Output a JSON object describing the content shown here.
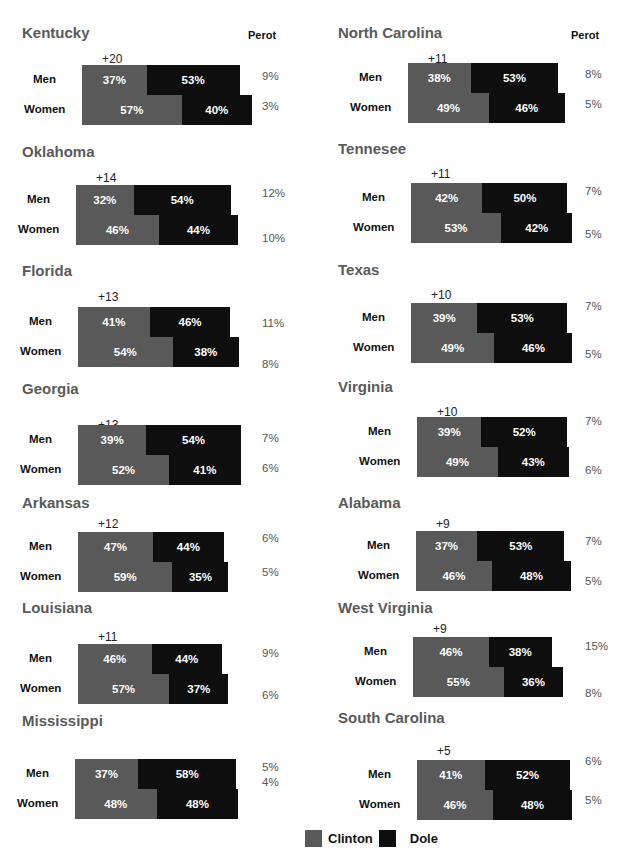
{
  "perot_header": "Perot",
  "legend": [
    {
      "label": "Clinton",
      "color": "#595959"
    },
    {
      "label": "Dole",
      "color": "#0e0e0e"
    }
  ],
  "panels": [
    {
      "state": "Kentucky",
      "gap": "+20",
      "men": {
        "label": "Men",
        "clinton": "37%",
        "dole": "53%",
        "perot": "9%"
      },
      "women": {
        "label": "Women",
        "clinton": "57%",
        "dole": "40%",
        "perot": "3%"
      }
    },
    {
      "state": "Oklahoma",
      "gap": "+14",
      "men": {
        "label": "Men",
        "clinton": "32%",
        "dole": "54%",
        "perot": "12%"
      },
      "women": {
        "label": "Women",
        "clinton": "46%",
        "dole": "44%",
        "perot": "10%"
      }
    },
    {
      "state": "Florida",
      "gap": "+13",
      "men": {
        "label": "Men",
        "clinton": "41%",
        "dole": "46%",
        "perot": "11%"
      },
      "women": {
        "label": "Women",
        "clinton": "54%",
        "dole": "38%",
        "perot": "8%"
      }
    },
    {
      "state": "Georgia",
      "gap": "+13",
      "men": {
        "label": "Men",
        "clinton": "39%",
        "dole": "54%",
        "perot": "7%"
      },
      "women": {
        "label": "Women",
        "clinton": "52%",
        "dole": "41%",
        "perot": "6%"
      }
    },
    {
      "state": "Arkansas",
      "gap": "+12",
      "men": {
        "label": "Men",
        "clinton": "47%",
        "dole": "44%",
        "perot": "6%"
      },
      "women": {
        "label": "Women",
        "clinton": "59%",
        "dole": "35%",
        "perot": "5%"
      }
    },
    {
      "state": "Louisiana",
      "gap": "+11",
      "men": {
        "label": "Men",
        "clinton": "46%",
        "dole": "44%",
        "perot": "9%"
      },
      "women": {
        "label": "Women",
        "clinton": "57%",
        "dole": "37%",
        "perot": "6%"
      }
    },
    {
      "state": "Mississippi",
      "gap": "+11",
      "men": {
        "label": "Men",
        "clinton": "37%",
        "dole": "58%",
        "perot": "5%"
      },
      "women": {
        "label": "Women",
        "clinton": "48%",
        "dole": "48%",
        "perot": "4%"
      }
    },
    {
      "state": "North Carolina",
      "gap": "+11",
      "men": {
        "label": "Men",
        "clinton": "38%",
        "dole": "53%",
        "perot": "8%"
      },
      "women": {
        "label": "Women",
        "clinton": "49%",
        "dole": "46%",
        "perot": "5%"
      }
    },
    {
      "state": "Tennesee",
      "gap": "+11",
      "men": {
        "label": "Men",
        "clinton": "42%",
        "dole": "50%",
        "perot": "7%"
      },
      "women": {
        "label": "Women",
        "clinton": "53%",
        "dole": "42%",
        "perot": "5%"
      }
    },
    {
      "state": "Texas",
      "gap": "+10",
      "men": {
        "label": "Men",
        "clinton": "39%",
        "dole": "53%",
        "perot": "7%"
      },
      "women": {
        "label": "Women",
        "clinton": "49%",
        "dole": "46%",
        "perot": "5%"
      }
    },
    {
      "state": "Virginia",
      "gap": "+10",
      "men": {
        "label": "Men",
        "clinton": "39%",
        "dole": "52%",
        "perot": "7%"
      },
      "women": {
        "label": "Women",
        "clinton": "49%",
        "dole": "43%",
        "perot": "6%"
      }
    },
    {
      "state": "Alabama",
      "gap": "+9",
      "men": {
        "label": "Men",
        "clinton": "37%",
        "dole": "53%",
        "perot": "7%"
      },
      "women": {
        "label": "Women",
        "clinton": "46%",
        "dole": "48%",
        "perot": "5%"
      }
    },
    {
      "state": "West Virginia",
      "gap": "+9",
      "men": {
        "label": "Men",
        "clinton": "46%",
        "dole": "38%",
        "perot": "15%"
      },
      "women": {
        "label": "Women",
        "clinton": "55%",
        "dole": "36%",
        "perot": "8%"
      }
    },
    {
      "state": "South Carolina",
      "gap": "+5",
      "men": {
        "label": "Men",
        "clinton": "41%",
        "dole": "52%",
        "perot": "6%"
      },
      "women": {
        "label": "Women",
        "clinton": "46%",
        "dole": "48%",
        "perot": "5%"
      }
    }
  ],
  "chart_data": {
    "type": "bar",
    "orientation": "horizontal-stacked",
    "title": "",
    "series_names": [
      "Clinton",
      "Dole",
      "Perot"
    ],
    "note": "Gender gap (+N) shown above each state panel; Perot share shown to the right of bars",
    "states": [
      {
        "state": "Kentucky",
        "gender_gap": 20,
        "men": {
          "Clinton": 37,
          "Dole": 53,
          "Perot": 9
        },
        "women": {
          "Clinton": 57,
          "Dole": 40,
          "Perot": 3
        }
      },
      {
        "state": "Oklahoma",
        "gender_gap": 14,
        "men": {
          "Clinton": 32,
          "Dole": 54,
          "Perot": 12
        },
        "women": {
          "Clinton": 46,
          "Dole": 44,
          "Perot": 10
        }
      },
      {
        "state": "Florida",
        "gender_gap": 13,
        "men": {
          "Clinton": 41,
          "Dole": 46,
          "Perot": 11
        },
        "women": {
          "Clinton": 54,
          "Dole": 38,
          "Perot": 8
        }
      },
      {
        "state": "Georgia",
        "gender_gap": 13,
        "men": {
          "Clinton": 39,
          "Dole": 54,
          "Perot": 7
        },
        "women": {
          "Clinton": 52,
          "Dole": 41,
          "Perot": 6
        }
      },
      {
        "state": "Arkansas",
        "gender_gap": 12,
        "men": {
          "Clinton": 47,
          "Dole": 44,
          "Perot": 6
        },
        "women": {
          "Clinton": 59,
          "Dole": 35,
          "Perot": 5
        }
      },
      {
        "state": "Louisiana",
        "gender_gap": 11,
        "men": {
          "Clinton": 46,
          "Dole": 44,
          "Perot": 9
        },
        "women": {
          "Clinton": 57,
          "Dole": 37,
          "Perot": 6
        }
      },
      {
        "state": "Mississippi",
        "gender_gap": 11,
        "men": {
          "Clinton": 37,
          "Dole": 58,
          "Perot": 5
        },
        "women": {
          "Clinton": 48,
          "Dole": 48,
          "Perot": 4
        }
      },
      {
        "state": "North Carolina",
        "gender_gap": 11,
        "men": {
          "Clinton": 38,
          "Dole": 53,
          "Perot": 8
        },
        "women": {
          "Clinton": 49,
          "Dole": 46,
          "Perot": 5
        }
      },
      {
        "state": "Tennesee",
        "gender_gap": 11,
        "men": {
          "Clinton": 42,
          "Dole": 50,
          "Perot": 7
        },
        "women": {
          "Clinton": 53,
          "Dole": 42,
          "Perot": 5
        }
      },
      {
        "state": "Texas",
        "gender_gap": 10,
        "men": {
          "Clinton": 39,
          "Dole": 53,
          "Perot": 7
        },
        "women": {
          "Clinton": 49,
          "Dole": 46,
          "Perot": 5
        }
      },
      {
        "state": "Virginia",
        "gender_gap": 10,
        "men": {
          "Clinton": 39,
          "Dole": 52,
          "Perot": 7
        },
        "women": {
          "Clinton": 49,
          "Dole": 43,
          "Perot": 6
        }
      },
      {
        "state": "Alabama",
        "gender_gap": 9,
        "men": {
          "Clinton": 37,
          "Dole": 53,
          "Perot": 7
        },
        "women": {
          "Clinton": 46,
          "Dole": 48,
          "Perot": 5
        }
      },
      {
        "state": "West Virginia",
        "gender_gap": 9,
        "men": {
          "Clinton": 46,
          "Dole": 38,
          "Perot": 15
        },
        "women": {
          "Clinton": 55,
          "Dole": 36,
          "Perot": 8
        }
      },
      {
        "state": "South Carolina",
        "gender_gap": 5,
        "men": {
          "Clinton": 41,
          "Dole": 52,
          "Perot": 6
        },
        "women": {
          "Clinton": 46,
          "Dole": 48,
          "Perot": 5
        }
      }
    ],
    "legend": [
      "Clinton",
      "Dole"
    ],
    "legend_position": "bottom-center"
  }
}
